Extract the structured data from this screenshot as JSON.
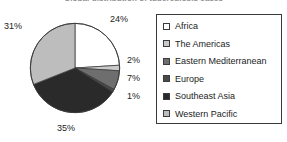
{
  "chart_data": {
    "type": "pie",
    "title": "Global distribution of tuberculosis cases",
    "categories": [
      "Africa",
      "The Americas",
      "Eastern Mediterranean",
      "Europe",
      "Southeast Asia",
      "Western Pacific"
    ],
    "values": [
      24,
      2,
      7,
      1,
      35,
      31
    ],
    "value_labels": [
      "24%",
      "2%",
      "7%",
      "1%",
      "35%",
      "31%"
    ],
    "colors": [
      "#ffffff",
      "#c9c9c9",
      "#6e6e6e",
      "#4a4a4a",
      "#2a2a2a",
      "#bdbdbd"
    ],
    "units": "percent",
    "total": 100,
    "start_angle": 0,
    "direction": "clockwise",
    "labels_position": "outside",
    "legend_position": "right",
    "grid": false,
    "xlabel": "",
    "ylabel": ""
  },
  "legend": {
    "items": [
      {
        "label": "Africa",
        "color": "#ffffff",
        "swatch_name": "swatch-africa"
      },
      {
        "label": "The Americas",
        "color": "#c9c9c9",
        "swatch_name": "swatch-the-americas"
      },
      {
        "label": "Eastern Mediterranean",
        "color": "#6e6e6e",
        "swatch_name": "swatch-eastern-mediterranean"
      },
      {
        "label": "Europe",
        "color": "#4a4a4a",
        "swatch_name": "swatch-europe"
      },
      {
        "label": "Southeast Asia",
        "color": "#2a2a2a",
        "swatch_name": "swatch-southeast-asia"
      },
      {
        "label": "Western Pacific",
        "color": "#bdbdbd",
        "swatch_name": "swatch-western-pacific"
      }
    ]
  }
}
